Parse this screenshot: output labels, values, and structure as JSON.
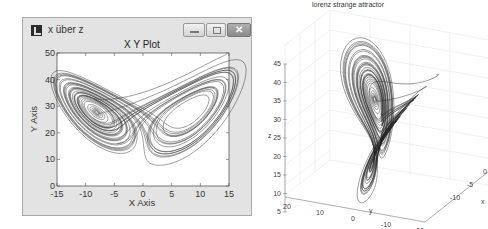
{
  "window": {
    "title": "x über z",
    "buttons": {
      "minimize": "",
      "maximize": "",
      "close": "✕"
    }
  },
  "chart_data": [
    {
      "type": "line",
      "title": "X Y Plot",
      "xlabel": "X Axis",
      "ylabel": "Y Axis",
      "xlim": [
        -15,
        15
      ],
      "ylim": [
        0,
        50
      ],
      "xticks": [
        "-15",
        "-10",
        "-5",
        "0",
        "5",
        "10",
        "15"
      ],
      "yticks": [
        "0",
        "10",
        "20",
        "30",
        "40",
        "50"
      ],
      "grid": false,
      "series": [
        {
          "name": "lorenz x vs z projection",
          "color": "#3a3a3a",
          "description": "Lorenz butterfly with two lobes centred near (-6,25) and (6,25); extents x≈-10..11, z≈5..43"
        }
      ]
    },
    {
      "type": "line",
      "title": "lorenz strange attractor",
      "xlabel": "x",
      "ylabel": "y",
      "zlabel": "z",
      "xticks": [
        "-10",
        "-5",
        "0"
      ],
      "yticks": [
        "20",
        "10",
        "0",
        "-10",
        "-20"
      ],
      "zticks": [
        "5",
        "10",
        "15",
        "20",
        "25",
        "30",
        "35",
        "40",
        "45"
      ],
      "grid": true,
      "series": [
        {
          "name": "lorenz 3D trajectory",
          "color": "#222222"
        }
      ]
    }
  ]
}
